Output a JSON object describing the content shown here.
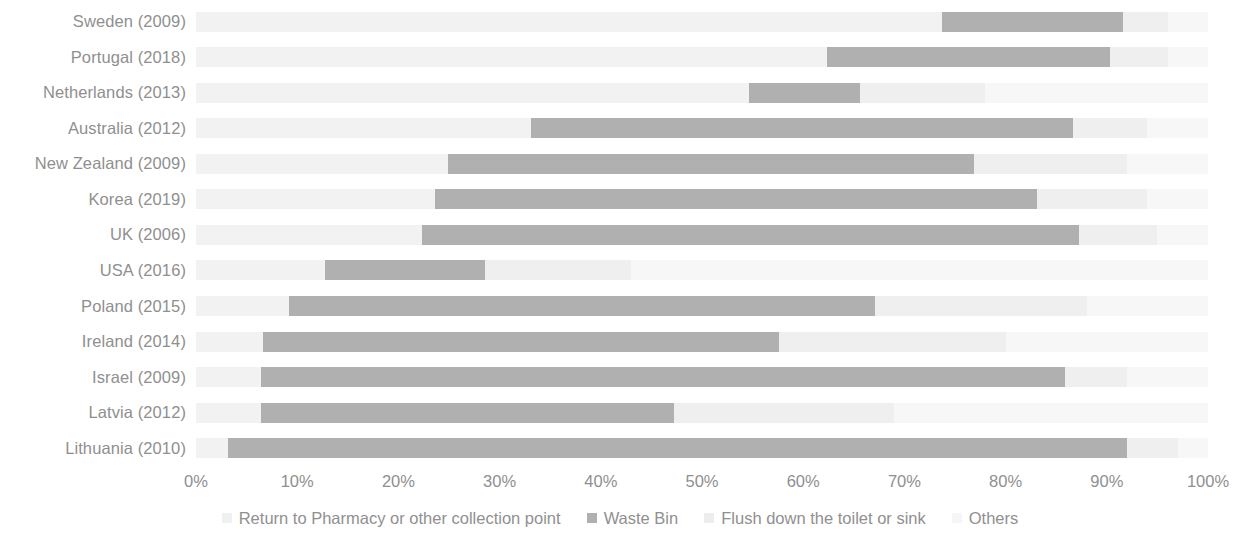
{
  "chart_data": {
    "type": "bar",
    "subtype": "stacked-horizontal-100",
    "title": "",
    "xlabel": "",
    "ylabel": "",
    "xlim": [
      0,
      100
    ],
    "grid": false,
    "legend_position": "bottom",
    "categories": [
      "Sweden (2009)",
      "Portugal (2018)",
      "Netherlands (2013)",
      "Australia (2012)",
      "New Zealand (2009)",
      "Korea (2019)",
      "UK (2006)",
      "USA (2016)",
      "Poland (2015)",
      "Ireland (2014)",
      "Israel (2009)",
      "Latvia (2012)",
      "Lithuania (2010)"
    ],
    "series": [
      {
        "name": "Return to Pharmacy or other collection point",
        "color": "#f2f2f2",
        "values": [
          73.7,
          62.4,
          54.6,
          33.1,
          24.9,
          23.6,
          22.3,
          12.7,
          9.2,
          6.6,
          6.4,
          6.4,
          3.2
        ]
      },
      {
        "name": "Waste Bin",
        "color": "#b0b0b0",
        "values": [
          17.9,
          27.9,
          11.0,
          53.6,
          52.0,
          59.5,
          65.0,
          15.9,
          57.9,
          51.0,
          79.5,
          40.8,
          88.8
        ]
      },
      {
        "name": "Flush down the toilet or sink",
        "color": "#efefef",
        "values": [
          4.4,
          5.7,
          12.4,
          7.3,
          15.1,
          10.9,
          7.7,
          14.4,
          20.9,
          22.4,
          6.1,
          21.8,
          5.0
        ]
      },
      {
        "name": "Others",
        "color": "#f7f7f7",
        "values": [
          4.0,
          4.0,
          22.0,
          6.0,
          8.0,
          6.0,
          5.0,
          57.0,
          12.0,
          20.0,
          8.0,
          31.0,
          3.0
        ]
      }
    ],
    "x_ticks": [
      "0%",
      "10%",
      "20%",
      "30%",
      "40%",
      "50%",
      "60%",
      "70%",
      "80%",
      "90%",
      "100%"
    ],
    "x_tick_values": [
      0,
      10,
      20,
      30,
      40,
      50,
      60,
      70,
      80,
      90,
      100
    ]
  },
  "legend": {
    "items": [
      {
        "label": "Return to Pharmacy or other collection point",
        "swatch": "sw-return"
      },
      {
        "label": "Waste Bin",
        "swatch": "sw-waste"
      },
      {
        "label": "Flush down the toilet or sink",
        "swatch": "sw-flush"
      },
      {
        "label": "Others",
        "swatch": "sw-others"
      }
    ]
  }
}
